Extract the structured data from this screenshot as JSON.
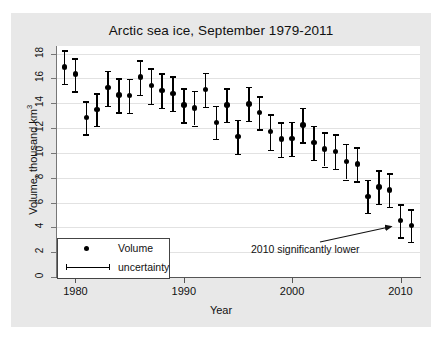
{
  "chart_data": {
    "type": "scatter",
    "title": "Arctic sea ice, September 1979-2011",
    "xlabel": "Year",
    "ylabel": "Volume, thousand km",
    "ylabel_sup": "3",
    "xlim": [
      1978.3,
      2011.8
    ],
    "ylim": [
      0,
      18.6
    ],
    "grid": true,
    "xticks": [
      1980,
      1990,
      2000,
      2010
    ],
    "yticks": [
      0,
      2,
      4,
      6,
      8,
      10,
      12,
      14,
      16,
      18
    ],
    "legend_position": "bottom-left",
    "legend": [
      {
        "marker": "dot",
        "label": "Volume"
      },
      {
        "marker": "errorbar",
        "label": "uncertainty"
      }
    ],
    "annotations": [
      {
        "text": "2010 significantly lower",
        "points_to_year": 2010,
        "text_x": 240,
        "text_y": 230
      }
    ],
    "series_name": "Volume",
    "x": [
      1979,
      1980,
      1981,
      1982,
      1983,
      1984,
      1985,
      1986,
      1987,
      1988,
      1989,
      1990,
      1991,
      1992,
      1993,
      1994,
      1995,
      1996,
      1997,
      1998,
      1999,
      2000,
      2001,
      2002,
      2003,
      2004,
      2005,
      2006,
      2007,
      2008,
      2009,
      2010,
      2011
    ],
    "values": [
      16.9,
      16.35,
      12.85,
      13.5,
      15.25,
      14.65,
      14.6,
      16.1,
      15.4,
      15.0,
      14.8,
      13.85,
      13.6,
      15.1,
      12.45,
      13.85,
      11.3,
      13.95,
      13.25,
      11.7,
      11.1,
      11.15,
      12.25,
      10.85,
      10.3,
      10.1,
      9.3,
      9.1,
      6.5,
      7.25,
      7.0,
      4.55,
      4.15
    ],
    "lower": [
      15.55,
      14.95,
      11.5,
      12.15,
      13.8,
      13.25,
      13.2,
      14.65,
      13.95,
      13.6,
      13.4,
      12.45,
      12.2,
      13.7,
      11.1,
      12.5,
      9.9,
      12.6,
      11.9,
      10.25,
      9.7,
      9.75,
      10.85,
      9.45,
      8.9,
      8.7,
      7.85,
      7.7,
      5.15,
      5.9,
      5.65,
      3.2,
      2.85
    ],
    "upper": [
      18.25,
      17.6,
      14.15,
      14.8,
      16.6,
      16.0,
      15.95,
      17.45,
      16.8,
      16.4,
      16.15,
      15.2,
      15.0,
      16.45,
      13.8,
      15.2,
      12.65,
      15.3,
      14.55,
      13.1,
      12.45,
      12.5,
      13.6,
      12.2,
      11.65,
      11.5,
      10.7,
      10.45,
      7.85,
      8.6,
      8.35,
      5.85,
      5.45
    ]
  },
  "colors": {
    "figure_background": "#e8e8e8",
    "plot_background": "#ffffff",
    "marker": "#000000",
    "grid": "#e2e2e2",
    "axis": "#555555",
    "text": "#111111"
  }
}
